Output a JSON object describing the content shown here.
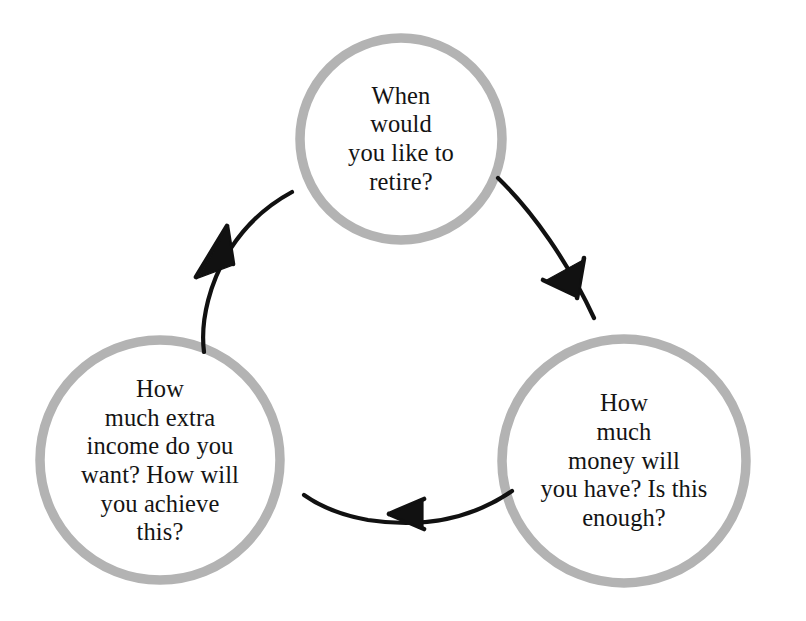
{
  "diagram": {
    "type": "cycle",
    "orientation": "clockwise",
    "background_color": "#ffffff",
    "node_stroke_color": "#b3b3b3",
    "node_fill_color": "#ffffff",
    "node_stroke_width": 9,
    "arrow_color": "#111111",
    "text_color": "#141414",
    "nodes": [
      {
        "id": "retirement-date",
        "position": "top",
        "label": "When\nwould\nyou like to\nretire?",
        "center_x": 401,
        "center_y": 139,
        "radius": 101
      },
      {
        "id": "money-available",
        "position": "bottom-right",
        "label": "How\nmuch\nmoney will\nyou have? Is this\nenough?",
        "center_x": 624,
        "center_y": 461,
        "radius": 122
      },
      {
        "id": "extra-income",
        "position": "bottom-left",
        "label": "How\nmuch extra\nincome do you\nwant? How will\nyou achieve\nthis?",
        "center_x": 160,
        "center_y": 460,
        "radius": 120
      }
    ],
    "arrows": [
      {
        "id": "top-to-right",
        "from": "retirement-date",
        "to": "money-available",
        "direction": "clockwise-down-right"
      },
      {
        "id": "right-to-left",
        "from": "money-available",
        "to": "extra-income",
        "direction": "leftward"
      },
      {
        "id": "left-to-top",
        "from": "extra-income",
        "to": "retirement-date",
        "direction": "upward-right"
      }
    ]
  }
}
